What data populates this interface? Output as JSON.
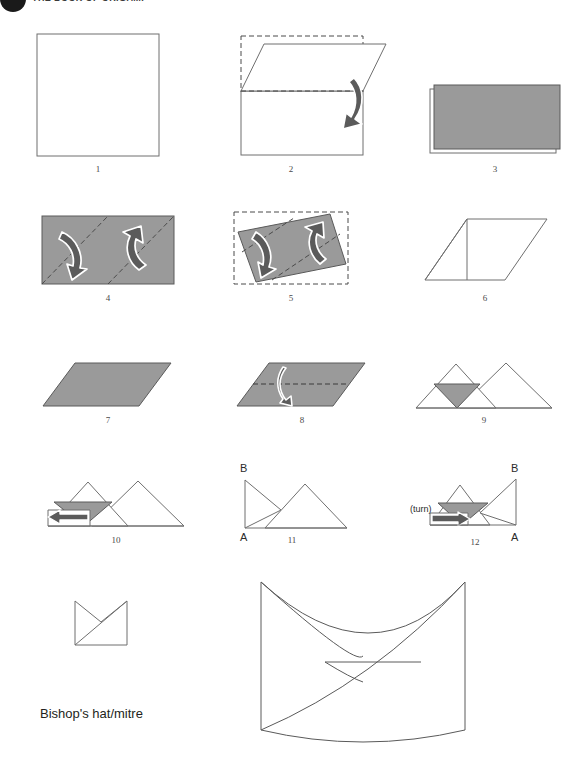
{
  "page": {
    "width": 572,
    "height": 777,
    "background": "#ffffff"
  },
  "header": {
    "title": "THE BOOK OF ORIGAMI",
    "dot_color": "#1a1a1a"
  },
  "colors": {
    "paper_fill": "#ffffff",
    "paper_stroke": "#6f6f6f",
    "shaded_fill": "#9a9a9a",
    "shaded_stroke": "#5a5a5a",
    "fold_dash": "#4a4a4a",
    "arrow_fill": "#5b5b5b",
    "arrow_stroke": "#ffffff",
    "text": "#231f20"
  },
  "caption": {
    "text": "Bishop's hat/mitre"
  },
  "steps": [
    {
      "id": 1,
      "label": "1",
      "description": "square-sheet"
    },
    {
      "id": 2,
      "label": "2",
      "description": "fold-top-edge-down"
    },
    {
      "id": 3,
      "label": "3",
      "description": "shaded-rectangle"
    },
    {
      "id": 4,
      "label": "4",
      "description": "rectangle-two-diagonal-folds"
    },
    {
      "id": 5,
      "label": "5",
      "description": "parallelogram-two-diagonal-folds"
    },
    {
      "id": 6,
      "label": "6",
      "description": "outline-parallelogram"
    },
    {
      "id": 7,
      "label": "7",
      "description": "shaded-parallelogram"
    },
    {
      "id": 8,
      "label": "8",
      "description": "parallelogram-horizontal-fold"
    },
    {
      "id": 9,
      "label": "9",
      "description": "twin-peaks-with-shaded-triangle"
    },
    {
      "id": 10,
      "label": "10",
      "description": "twin-peaks-tuck-left"
    },
    {
      "id": 11,
      "label": "11",
      "description": "twin-peaks-labelled-A-B"
    },
    {
      "id": 12,
      "label": "12",
      "description": "turn-over-labelled-A-B"
    }
  ],
  "annotations": {
    "turn": "(turn)",
    "point_a": "A",
    "point_b": "B"
  },
  "final": {
    "small_model": "finished-mitre-flat",
    "large_model": "finished-mitre-3d"
  }
}
